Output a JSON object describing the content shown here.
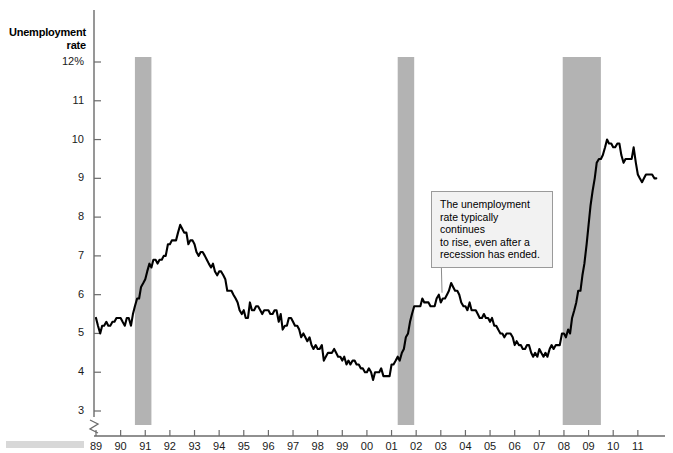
{
  "chart_data": {
    "type": "line",
    "title": "Unemployment rate",
    "ylabel": "Unemployment rate",
    "xlabel": "",
    "ylim": [
      3,
      12
    ],
    "yticks": [
      "12%",
      "11",
      "10",
      "9",
      "8",
      "7",
      "6",
      "5",
      "4",
      "3"
    ],
    "ytick_values": [
      12,
      11,
      10,
      9,
      8,
      7,
      6,
      5,
      4,
      3
    ],
    "axis_break": true,
    "grid": false,
    "legend": "none",
    "xlim": [
      1989,
      2011.9
    ],
    "xticks": [
      "89",
      "90",
      "91",
      "92",
      "93",
      "94",
      "95",
      "96",
      "97",
      "98",
      "99",
      "00",
      "01",
      "02",
      "03",
      "04",
      "05",
      "06",
      "07",
      "08",
      "09",
      "10",
      "11"
    ],
    "xtick_values": [
      1989,
      1990,
      1991,
      1992,
      1993,
      1994,
      1995,
      1996,
      1997,
      1998,
      1999,
      2000,
      2001,
      2002,
      2003,
      2004,
      2005,
      2006,
      2007,
      2008,
      2009,
      2010,
      2011
    ],
    "line_color": "#000000",
    "recession_color": "#b3b3b3",
    "annotations": [
      {
        "text": "The unemployment rate typically continues to rise, even after a recession has ended.",
        "lines": [
          "The unemployment",
          "rate typically continues",
          "to rise, even after a",
          "recession has ended."
        ],
        "box_fill": "#f2f2f2",
        "box_border": "#9a9a9a",
        "target_x": 2003.05,
        "target_y": 6.05
      }
    ],
    "recessions": [
      {
        "start": 1990.58,
        "end": 1991.25
      },
      {
        "start": 2001.25,
        "end": 2001.92
      },
      {
        "start": 2007.95,
        "end": 2009.5
      }
    ],
    "x": [
      1989.0,
      1989.08,
      1989.17,
      1989.25,
      1989.33,
      1989.42,
      1989.5,
      1989.58,
      1989.67,
      1989.75,
      1989.83,
      1989.92,
      1990.0,
      1990.08,
      1990.17,
      1990.25,
      1990.33,
      1990.42,
      1990.5,
      1990.58,
      1990.67,
      1990.75,
      1990.83,
      1990.92,
      1991.0,
      1991.08,
      1991.17,
      1991.25,
      1991.33,
      1991.42,
      1991.5,
      1991.58,
      1991.67,
      1991.75,
      1991.83,
      1991.92,
      1992.0,
      1992.08,
      1992.17,
      1992.25,
      1992.33,
      1992.42,
      1992.5,
      1992.58,
      1992.67,
      1992.75,
      1992.83,
      1992.92,
      1993.0,
      1993.08,
      1993.17,
      1993.25,
      1993.33,
      1993.42,
      1993.5,
      1993.58,
      1993.67,
      1993.75,
      1993.83,
      1993.92,
      1994.0,
      1994.08,
      1994.17,
      1994.25,
      1994.33,
      1994.42,
      1994.5,
      1994.58,
      1994.67,
      1994.75,
      1994.83,
      1994.92,
      1995.0,
      1995.08,
      1995.17,
      1995.25,
      1995.33,
      1995.42,
      1995.5,
      1995.58,
      1995.67,
      1995.75,
      1995.83,
      1995.92,
      1996.0,
      1996.08,
      1996.17,
      1996.25,
      1996.33,
      1996.42,
      1996.5,
      1996.58,
      1996.67,
      1996.75,
      1996.83,
      1996.92,
      1997.0,
      1997.08,
      1997.17,
      1997.25,
      1997.33,
      1997.42,
      1997.5,
      1997.58,
      1997.67,
      1997.75,
      1997.83,
      1997.92,
      1998.0,
      1998.08,
      1998.17,
      1998.25,
      1998.33,
      1998.42,
      1998.5,
      1998.58,
      1998.67,
      1998.75,
      1998.83,
      1998.92,
      1999.0,
      1999.08,
      1999.17,
      1999.25,
      1999.33,
      1999.42,
      1999.5,
      1999.58,
      1999.67,
      1999.75,
      1999.83,
      1999.92,
      2000.0,
      2000.08,
      2000.17,
      2000.25,
      2000.33,
      2000.42,
      2000.5,
      2000.58,
      2000.67,
      2000.75,
      2000.83,
      2000.92,
      2001.0,
      2001.08,
      2001.17,
      2001.25,
      2001.33,
      2001.42,
      2001.5,
      2001.58,
      2001.67,
      2001.75,
      2001.83,
      2001.92,
      2002.0,
      2002.08,
      2002.17,
      2002.25,
      2002.33,
      2002.42,
      2002.5,
      2002.58,
      2002.67,
      2002.75,
      2002.83,
      2002.92,
      2003.0,
      2003.08,
      2003.17,
      2003.25,
      2003.33,
      2003.42,
      2003.5,
      2003.58,
      2003.67,
      2003.75,
      2003.83,
      2003.92,
      2004.0,
      2004.08,
      2004.17,
      2004.25,
      2004.33,
      2004.42,
      2004.5,
      2004.58,
      2004.67,
      2004.75,
      2004.83,
      2004.92,
      2005.0,
      2005.08,
      2005.17,
      2005.25,
      2005.33,
      2005.42,
      2005.5,
      2005.58,
      2005.67,
      2005.75,
      2005.83,
      2005.92,
      2006.0,
      2006.08,
      2006.17,
      2006.25,
      2006.33,
      2006.42,
      2006.5,
      2006.58,
      2006.67,
      2006.75,
      2006.83,
      2006.92,
      2007.0,
      2007.08,
      2007.17,
      2007.25,
      2007.33,
      2007.42,
      2007.5,
      2007.58,
      2007.67,
      2007.75,
      2007.83,
      2007.92,
      2008.0,
      2008.08,
      2008.17,
      2008.25,
      2008.33,
      2008.42,
      2008.5,
      2008.58,
      2008.67,
      2008.75,
      2008.83,
      2008.92,
      2009.0,
      2009.08,
      2009.17,
      2009.25,
      2009.33,
      2009.42,
      2009.5,
      2009.58,
      2009.67,
      2009.75,
      2009.83,
      2009.92,
      2010.0,
      2010.08,
      2010.17,
      2010.25,
      2010.33,
      2010.42,
      2010.5,
      2010.58,
      2010.67,
      2010.75,
      2010.83,
      2010.92,
      2011.0,
      2011.08,
      2011.17,
      2011.25,
      2011.33,
      2011.42,
      2011.5,
      2011.58,
      2011.67,
      2011.75
    ],
    "values": [
      5.4,
      5.2,
      5.0,
      5.2,
      5.2,
      5.3,
      5.2,
      5.2,
      5.3,
      5.3,
      5.4,
      5.4,
      5.4,
      5.3,
      5.2,
      5.4,
      5.4,
      5.2,
      5.5,
      5.7,
      5.9,
      5.9,
      6.2,
      6.3,
      6.4,
      6.6,
      6.8,
      6.7,
      6.9,
      6.9,
      6.8,
      6.9,
      6.9,
      7.0,
      7.0,
      7.3,
      7.3,
      7.4,
      7.4,
      7.4,
      7.6,
      7.8,
      7.7,
      7.6,
      7.6,
      7.3,
      7.4,
      7.4,
      7.3,
      7.1,
      7.0,
      7.1,
      7.1,
      7.0,
      6.9,
      6.8,
      6.7,
      6.8,
      6.6,
      6.5,
      6.6,
      6.6,
      6.5,
      6.4,
      6.1,
      6.1,
      6.1,
      6.0,
      5.9,
      5.8,
      5.6,
      5.5,
      5.6,
      5.4,
      5.4,
      5.8,
      5.6,
      5.6,
      5.7,
      5.7,
      5.6,
      5.5,
      5.6,
      5.6,
      5.6,
      5.5,
      5.5,
      5.6,
      5.6,
      5.3,
      5.5,
      5.1,
      5.2,
      5.2,
      5.4,
      5.4,
      5.3,
      5.2,
      5.2,
      5.1,
      4.9,
      5.0,
      4.9,
      4.8,
      4.9,
      4.7,
      4.6,
      4.7,
      4.6,
      4.6,
      4.7,
      4.3,
      4.4,
      4.5,
      4.5,
      4.5,
      4.6,
      4.5,
      4.4,
      4.4,
      4.3,
      4.4,
      4.2,
      4.3,
      4.2,
      4.3,
      4.3,
      4.2,
      4.2,
      4.1,
      4.1,
      4.0,
      4.0,
      4.1,
      4.0,
      3.8,
      4.0,
      4.0,
      4.0,
      4.1,
      3.9,
      3.9,
      3.9,
      3.9,
      4.2,
      4.2,
      4.3,
      4.4,
      4.3,
      4.5,
      4.6,
      4.9,
      5.0,
      5.3,
      5.5,
      5.7,
      5.7,
      5.7,
      5.7,
      5.9,
      5.8,
      5.8,
      5.8,
      5.7,
      5.7,
      5.7,
      5.9,
      6.0,
      5.8,
      5.9,
      5.9,
      6.0,
      6.1,
      6.3,
      6.2,
      6.1,
      6.1,
      6.0,
      5.8,
      5.7,
      5.7,
      5.6,
      5.8,
      5.6,
      5.6,
      5.6,
      5.5,
      5.4,
      5.4,
      5.5,
      5.4,
      5.4,
      5.3,
      5.4,
      5.2,
      5.2,
      5.1,
      5.0,
      5.0,
      4.9,
      5.0,
      5.0,
      5.0,
      4.9,
      4.7,
      4.8,
      4.7,
      4.7,
      4.6,
      4.6,
      4.7,
      4.7,
      4.5,
      4.4,
      4.5,
      4.4,
      4.6,
      4.5,
      4.4,
      4.5,
      4.4,
      4.6,
      4.7,
      4.6,
      4.7,
      4.7,
      4.7,
      5.0,
      5.0,
      4.9,
      5.1,
      5.0,
      5.4,
      5.6,
      5.8,
      6.1,
      6.1,
      6.5,
      6.8,
      7.3,
      7.8,
      8.3,
      8.7,
      9.0,
      9.4,
      9.5,
      9.5,
      9.6,
      9.8,
      10.0,
      9.9,
      9.9,
      9.8,
      9.8,
      9.9,
      9.9,
      9.6,
      9.4,
      9.5,
      9.5,
      9.5,
      9.5,
      9.8,
      9.4,
      9.1,
      9.0,
      8.9,
      9.0,
      9.1,
      9.1,
      9.1,
      9.1,
      9.0,
      9.0
    ]
  },
  "footer": {
    "bar_color": "#d8d8d8"
  }
}
